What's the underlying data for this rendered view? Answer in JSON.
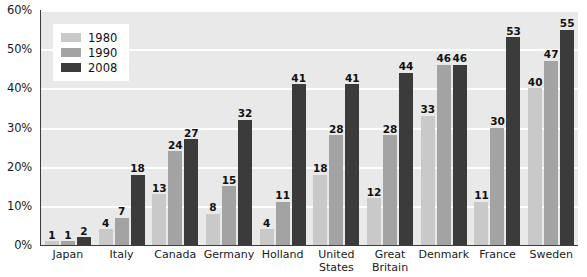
{
  "chart_data": {
    "type": "bar",
    "title": "",
    "subtitle": "",
    "xlabel": "",
    "ylabel": "",
    "ylim": [
      0,
      60
    ],
    "ytick_values": [
      0,
      10,
      20,
      30,
      40,
      50,
      60
    ],
    "ytick_labels": [
      "0%",
      "10%",
      "20%",
      "30%",
      "40%",
      "50%",
      "60%"
    ],
    "grid": true,
    "legend_position": "top-left",
    "categories": [
      "Japan",
      "Italy",
      "Canada",
      "Germany",
      "Holland",
      "United\nStates",
      "Great\nBritain",
      "Denmark",
      "France",
      "Sweden"
    ],
    "series": [
      {
        "name": "1980",
        "color": "#c9c9c9",
        "values": [
          1,
          4,
          13,
          8,
          4,
          18,
          12,
          33,
          11,
          40
        ]
      },
      {
        "name": "1990",
        "color": "#a3a3a3",
        "values": [
          1,
          7,
          24,
          15,
          11,
          28,
          28,
          46,
          30,
          47
        ]
      },
      {
        "name": "2008",
        "color": "#3b3b3b",
        "values": [
          2,
          18,
          27,
          32,
          41,
          41,
          44,
          46,
          53,
          55
        ]
      }
    ]
  },
  "legend": {
    "items": [
      {
        "label": "1980",
        "color": "#c9c9c9"
      },
      {
        "label": "1990",
        "color": "#a3a3a3"
      },
      {
        "label": "2008",
        "color": "#3b3b3b"
      }
    ]
  },
  "colors": {
    "plot_background": "#e9e9e9",
    "gridline": "#ffffff",
    "axis": "#3c3c3c",
    "text": "#1a1a1a",
    "series_1980": "#c9c9c9",
    "series_1990": "#a3a3a3",
    "series_2008": "#3b3b3b"
  }
}
